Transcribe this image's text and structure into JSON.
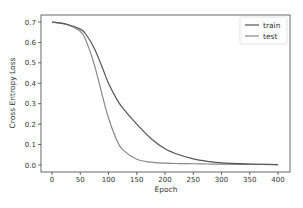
{
  "chart_data": {
    "type": "line",
    "title": "",
    "xlabel": "Epoch",
    "ylabel": "Cross Entropy Loss",
    "xlim": [
      -20,
      420
    ],
    "ylim": [
      -0.035,
      0.735
    ],
    "xticks": [
      0,
      50,
      100,
      150,
      200,
      250,
      300,
      350,
      400
    ],
    "yticks": [
      0.0,
      0.1,
      0.2,
      0.3,
      0.4,
      0.5,
      0.6,
      0.7
    ],
    "xtick_labels": [
      "0",
      "50",
      "100",
      "150",
      "200",
      "250",
      "300",
      "350",
      "400"
    ],
    "ytick_labels": [
      "0.0",
      "0.1",
      "0.2",
      "0.3",
      "0.4",
      "0.5",
      "0.6",
      "0.7"
    ],
    "grid": false,
    "legend_position": "upper right",
    "x": [
      0,
      25,
      50,
      60,
      75,
      90,
      100,
      115,
      125,
      150,
      175,
      200,
      225,
      250,
      275,
      300,
      350,
      400
    ],
    "series": [
      {
        "name": "train",
        "color": "#555555",
        "values": [
          0.7,
          0.69,
          0.665,
          0.64,
          0.57,
          0.47,
          0.4,
          0.32,
          0.28,
          0.2,
          0.13,
          0.08,
          0.05,
          0.03,
          0.018,
          0.01,
          0.005,
          0.002
        ]
      },
      {
        "name": "test",
        "color": "#888888",
        "values": [
          0.7,
          0.688,
          0.655,
          0.61,
          0.49,
          0.33,
          0.23,
          0.12,
          0.075,
          0.028,
          0.014,
          0.009,
          0.007,
          0.006,
          0.005,
          0.004,
          0.003,
          0.002
        ]
      }
    ]
  },
  "legend": {
    "items": [
      {
        "label": "train",
        "color": "#555555"
      },
      {
        "label": "test",
        "color": "#888888"
      }
    ]
  },
  "axes": {
    "xlabel": "Epoch",
    "ylabel": "Cross Entropy Loss"
  }
}
